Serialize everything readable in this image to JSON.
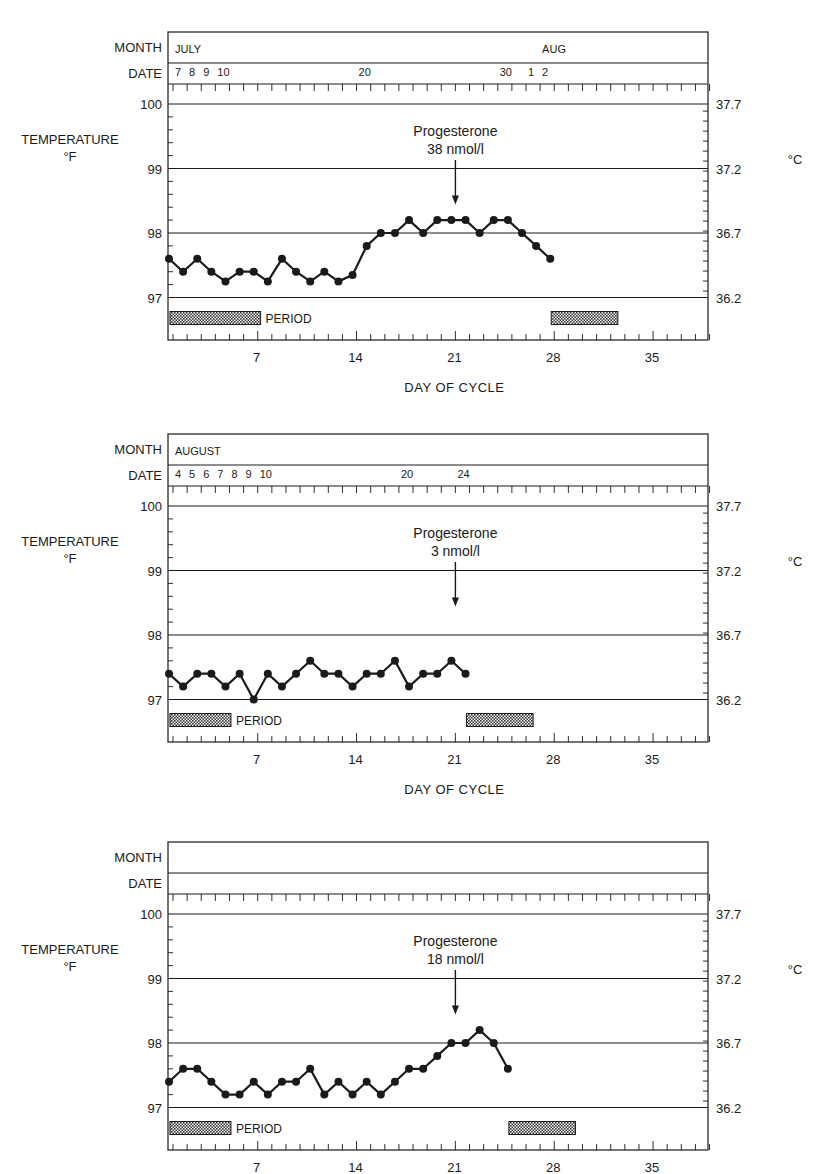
{
  "labels": {
    "month": "MONTH",
    "date": "DATE",
    "temperature": "TEMPERATURE",
    "fahrenheit": "°F",
    "celsius": "°C",
    "period": "PERIOD",
    "x_axis_title": "DAY OF CYCLE",
    "progesterone": "Progesterone"
  },
  "colors": {
    "ink": "#1a1a1a",
    "hatch": "#555555",
    "background": "#ffffff"
  },
  "chart_data": [
    {
      "type": "line",
      "title": "Cycle 1",
      "month_labels": [
        {
          "text": "JULY",
          "day": 1
        },
        {
          "text": "AUG",
          "day": 27
        }
      ],
      "date_labels": [
        {
          "text": "7",
          "day": 1
        },
        {
          "text": "8",
          "day": 2
        },
        {
          "text": "9",
          "day": 3
        },
        {
          "text": "10",
          "day": 4
        },
        {
          "text": "20",
          "day": 14
        },
        {
          "text": "30",
          "day": 24
        },
        {
          "text": "1",
          "day": 26
        },
        {
          "text": "2",
          "day": 27
        }
      ],
      "xlabel": "DAY OF CYCLE",
      "ylabel": "TEMPERATURE °F",
      "y2label": "°C",
      "x_ticks": [
        7,
        14,
        21,
        28,
        35
      ],
      "y_ticks": [
        97,
        98,
        99,
        100
      ],
      "y2_ticks": [
        "36.2",
        "36.7",
        "37.2",
        "37.7"
      ],
      "xlim": [
        1,
        39
      ],
      "ylim": [
        96.3,
        100.4
      ],
      "grid": "horizontal at whole °F",
      "annotation": {
        "text": "Progesterone",
        "value": "38 nmol/l",
        "day": 21
      },
      "period_bars": [
        {
          "start": 1,
          "end": 6.7,
          "label": "PERIOD"
        },
        {
          "start": 28,
          "end": 32
        }
      ],
      "series": [
        {
          "name": "Basal body temperature",
          "x": [
            1,
            2,
            3,
            4,
            5,
            6,
            7,
            8,
            9,
            10,
            11,
            12,
            13,
            14,
            15,
            16,
            17,
            18,
            19,
            20,
            21,
            22,
            23,
            24,
            25,
            26,
            27,
            28
          ],
          "values": [
            97.6,
            97.4,
            97.6,
            97.4,
            97.25,
            97.4,
            97.4,
            97.25,
            97.6,
            97.4,
            97.25,
            97.4,
            97.25,
            97.35,
            97.8,
            98.0,
            98.0,
            98.2,
            98.0,
            98.2,
            98.2,
            98.2,
            98.0,
            98.2,
            98.2,
            98.0,
            97.8,
            97.6
          ]
        }
      ]
    },
    {
      "type": "line",
      "title": "Cycle 2",
      "month_labels": [
        {
          "text": "AUGUST",
          "day": 1
        }
      ],
      "date_labels": [
        {
          "text": "4",
          "day": 1
        },
        {
          "text": "5",
          "day": 2
        },
        {
          "text": "6",
          "day": 3
        },
        {
          "text": "7",
          "day": 4
        },
        {
          "text": "8",
          "day": 5
        },
        {
          "text": "9",
          "day": 6
        },
        {
          "text": "10",
          "day": 7
        },
        {
          "text": "20",
          "day": 17
        },
        {
          "text": "24",
          "day": 21
        }
      ],
      "xlabel": "DAY OF CYCLE",
      "ylabel": "TEMPERATURE °F",
      "y2label": "°C",
      "x_ticks": [
        7,
        14,
        21,
        28,
        35
      ],
      "y_ticks": [
        97,
        98,
        99,
        100
      ],
      "y2_ticks": [
        "36.2",
        "36.7",
        "37.2",
        "37.7"
      ],
      "xlim": [
        1,
        39
      ],
      "ylim": [
        96.3,
        100.4
      ],
      "grid": "horizontal at whole °F",
      "annotation": {
        "text": "Progesterone",
        "value": "3 nmol/l",
        "day": 21
      },
      "period_bars": [
        {
          "start": 1,
          "end": 4.6,
          "label": "PERIOD"
        },
        {
          "start": 22,
          "end": 26
        }
      ],
      "series": [
        {
          "name": "Basal body temperature",
          "x": [
            1,
            2,
            3,
            4,
            5,
            6,
            7,
            8,
            9,
            10,
            11,
            12,
            13,
            14,
            15,
            16,
            17,
            18,
            19,
            20,
            21,
            22
          ],
          "values": [
            97.4,
            97.2,
            97.4,
            97.4,
            97.2,
            97.4,
            97.0,
            97.4,
            97.2,
            97.4,
            97.6,
            97.4,
            97.4,
            97.2,
            97.4,
            97.4,
            97.6,
            97.2,
            97.4,
            97.4,
            97.6,
            97.4
          ]
        }
      ]
    },
    {
      "type": "line",
      "title": "Cycle 3",
      "month_labels": [],
      "date_labels": [],
      "xlabel": "",
      "ylabel": "TEMPERATURE °F",
      "y2label": "°C",
      "x_ticks": [
        7,
        14,
        21,
        28,
        35
      ],
      "y_ticks": [
        97,
        98,
        99,
        100
      ],
      "y2_ticks": [
        "36.2",
        "36.7",
        "37.2",
        "37.7"
      ],
      "xlim": [
        1,
        39
      ],
      "ylim": [
        96.3,
        100.4
      ],
      "grid": "horizontal at whole °F",
      "annotation": {
        "text": "Progesterone",
        "value": "18 nmol/l",
        "day": 21
      },
      "period_bars": [
        {
          "start": 1,
          "end": 4.6,
          "label": "PERIOD"
        },
        {
          "start": 25,
          "end": 29
        }
      ],
      "series": [
        {
          "name": "Basal body temperature",
          "x": [
            1,
            2,
            3,
            4,
            5,
            6,
            7,
            8,
            9,
            10,
            11,
            12,
            13,
            14,
            15,
            16,
            17,
            18,
            19,
            20,
            21,
            22,
            23,
            24,
            25
          ],
          "values": [
            97.4,
            97.6,
            97.6,
            97.4,
            97.2,
            97.2,
            97.4,
            97.2,
            97.4,
            97.4,
            97.6,
            97.2,
            97.4,
            97.2,
            97.4,
            97.2,
            97.4,
            97.6,
            97.6,
            97.8,
            98.0,
            98.0,
            98.2,
            98.0,
            97.6
          ]
        }
      ]
    }
  ]
}
